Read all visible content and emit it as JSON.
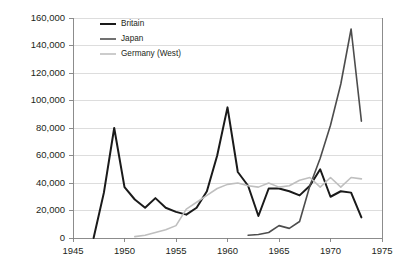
{
  "chart_data": {
    "type": "line",
    "title": "",
    "subtitle": "",
    "xlabel": "",
    "ylabel": "",
    "xlim": [
      1945,
      1975
    ],
    "ylim": [
      0,
      160000
    ],
    "grid": true,
    "legend_position": "top-left",
    "x_ticks": [
      "1945",
      "1950",
      "1955",
      "1960",
      "1965",
      "1970",
      "1975"
    ],
    "x_tick_values": [
      1945,
      1950,
      1955,
      1960,
      1965,
      1970,
      1975
    ],
    "y_ticks": [
      "0",
      "20,000",
      "40,000",
      "60,000",
      "80,000",
      "100,000",
      "120,000",
      "140,000",
      "160,000"
    ],
    "y_tick_values": [
      0,
      20000,
      40000,
      60000,
      80000,
      100000,
      120000,
      140000,
      160000
    ],
    "series": [
      {
        "name": "Britain",
        "color": "#1a1a1a",
        "width": 2.0,
        "x": [
          1947,
          1948,
          1949,
          1950,
          1951,
          1952,
          1953,
          1954,
          1955,
          1956,
          1957,
          1958,
          1959,
          1960,
          1961,
          1962,
          1963,
          1964,
          1965,
          1966,
          1967,
          1968,
          1969,
          1970,
          1971,
          1972,
          1973
        ],
        "y": [
          0,
          33000,
          80000,
          37000,
          28000,
          22000,
          29000,
          22000,
          19000,
          17000,
          22000,
          34000,
          60000,
          95000,
          48000,
          38000,
          16000,
          36000,
          36000,
          34000,
          31000,
          38000,
          50000,
          30000,
          34000,
          33000,
          15000
        ]
      },
      {
        "name": "Japan",
        "color": "#4d4d4d",
        "width": 1.6,
        "x": [
          1962,
          1963,
          1964,
          1965,
          1966,
          1967,
          1968,
          1969,
          1970,
          1971,
          1972,
          1973
        ],
        "y": [
          2000,
          2500,
          4000,
          9000,
          7000,
          12000,
          38000,
          58000,
          82000,
          112000,
          152000,
          85000
        ]
      },
      {
        "name": "Germany (West)",
        "color": "#bfbfbf",
        "width": 1.6,
        "x": [
          1951,
          1952,
          1953,
          1954,
          1955,
          1956,
          1957,
          1958,
          1959,
          1960,
          1961,
          1962,
          1963,
          1964,
          1965,
          1966,
          1967,
          1968,
          1969,
          1970,
          1971,
          1972,
          1973
        ],
        "y": [
          1000,
          2000,
          4000,
          6000,
          9000,
          21000,
          26000,
          31000,
          36000,
          39000,
          40000,
          38000,
          37000,
          40000,
          37000,
          38000,
          42000,
          44000,
          37000,
          44000,
          37000,
          44000,
          43000
        ]
      }
    ]
  },
  "legend": {
    "items": [
      {
        "label": "Britain"
      },
      {
        "label": "Japan"
      },
      {
        "label": "Germany (West)"
      }
    ]
  },
  "layout": {
    "plot_left": 73,
    "plot_right": 382,
    "plot_top": 18,
    "plot_bottom": 238
  }
}
